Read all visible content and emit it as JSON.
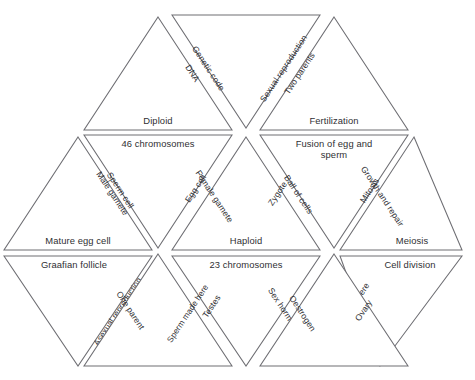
{
  "figure": {
    "kind": "tarsia-triangle-puzzle",
    "topic": "Reproduction, cell division and genetics",
    "stroke_color": "#6e6e73",
    "text_color": "#2f2f33",
    "background_color": "#ffffff",
    "rows": 4,
    "tile_count": 16
  },
  "tiles": [
    {
      "id": "r1-up-left",
      "row": 1,
      "orientation": "up",
      "base_label": "Diploid",
      "right_edge_label": "DNA"
    },
    {
      "id": "r1-down-center",
      "row": 1,
      "orientation": "down",
      "left_edge_label": "Genetic code",
      "right_edge_label": "Sexual reproduction"
    },
    {
      "id": "r1-up-right",
      "row": 1,
      "orientation": "up",
      "base_label": "Fertilization",
      "left_edge_label": "Two parents"
    },
    {
      "id": "r2-down-left",
      "row": 2,
      "orientation": "down",
      "top_label": "46 chromosomes",
      "left_edge_label": "Sperm cell",
      "right_edge_label": "Egg cell"
    },
    {
      "id": "r2-down-right",
      "row": 2,
      "orientation": "down",
      "top_label": "Fusion of egg and sperm",
      "left_edge_label": "Ball of cells",
      "right_edge_label": "Mitosis"
    },
    {
      "id": "r2-up-far-left",
      "row": 2,
      "orientation": "up",
      "base_label": "Mature egg cell",
      "right_edge_label": "Male gamete"
    },
    {
      "id": "r2-up-center",
      "row": 2,
      "orientation": "up",
      "base_label": "Haploid",
      "left_edge_label": "Female gamete",
      "right_edge_label": "Zygote"
    },
    {
      "id": "r2-up-far-right",
      "row": 2,
      "orientation": "up",
      "base_label": "Meiosis",
      "left_edge_label": "Growth and repair"
    },
    {
      "id": "r3-down-far-left",
      "row": 3,
      "orientation": "down",
      "top_label": "Graafian follicle",
      "right_edge_label": "Asexual reproduction"
    },
    {
      "id": "r3-down-center",
      "row": 3,
      "orientation": "down",
      "top_label": "23 chromosomes",
      "left_edge_label": "Testes",
      "right_edge_label": "Sex hormone"
    },
    {
      "id": "r3-down-far-right",
      "row": 3,
      "orientation": "down",
      "top_label": "Cell division",
      "left_edge_label": "Eggs made here"
    },
    {
      "id": "r3-up-left",
      "row": 3,
      "orientation": "up",
      "left_edge_label": "One parent",
      "right_edge_label": "Sperm made here"
    },
    {
      "id": "r3-up-right",
      "row": 3,
      "orientation": "up",
      "left_edge_label": "Oestrogen",
      "right_edge_label": "Ovary"
    }
  ],
  "labels": {
    "diploid": "Diploid",
    "dna": "DNA",
    "genetic_code": "Genetic code",
    "sexual_reproduction": "Sexual reproduction",
    "two_parents": "Two parents",
    "fertilization": "Fertilization",
    "chromosomes_46": "46 chromosomes",
    "fusion_line1": "Fusion of egg and",
    "fusion_line2": "sperm",
    "sperm_cell": "Sperm cell",
    "egg_cell": "Egg cell",
    "male_gamete": "Male gamete",
    "female_gamete": "Female gamete",
    "zygote": "Zygote",
    "ball_of_cells": "Ball of cells",
    "mitosis": "Mitosis",
    "growth_and_repair": "Growth and repair",
    "mature_egg_cell": "Mature egg cell",
    "haploid": "Haploid",
    "meiosis": "Meiosis",
    "graafian_follicle": "Graafian follicle",
    "chromosomes_23": "23 chromosomes",
    "cell_division": "Cell division",
    "asexual_reproduction": "Asexual reproduction",
    "one_parent": "One parent",
    "sperm_made_here": "Sperm made here",
    "testes": "Testes",
    "sex_hormone": "Sex hormone",
    "oestrogen": "Oestrogen",
    "ovary": "Ovary",
    "eggs_made_here": "Eggs made here"
  }
}
